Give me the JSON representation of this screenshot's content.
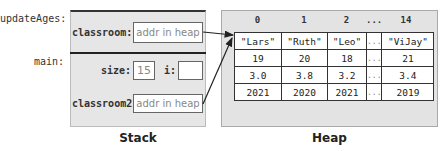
{
  "stack": {
    "caption": "Stack",
    "frames": [
      {
        "name": "updateAges:",
        "vars": [
          {
            "label": "classroom:",
            "value": "addr in heap"
          }
        ]
      },
      {
        "name": "main:",
        "vars": [
          {
            "label": "size:",
            "value": "15"
          },
          {
            "label": "i:",
            "value": ""
          },
          {
            "label": "classroom2:",
            "value": "addr in heap"
          }
        ]
      }
    ]
  },
  "heap": {
    "caption": "Heap",
    "indices": [
      "0",
      "1",
      "2",
      "...",
      "14"
    ],
    "rows": [
      [
        "\"Lars\"",
        "\"Ruth\"",
        "\"Leo\"",
        "...",
        "\"ViJay\""
      ],
      [
        "19",
        "20",
        "18",
        "...",
        "21"
      ],
      [
        "3.0",
        "3.8",
        "3.2",
        "...",
        "3.4"
      ],
      [
        "2021",
        "2020",
        "2021",
        "...",
        "2019"
      ]
    ]
  }
}
